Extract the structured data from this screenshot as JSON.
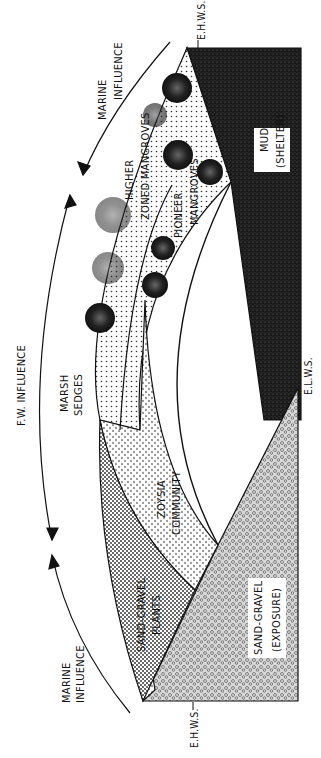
{
  "diagram": {
    "orientation": "rotated 90deg counter-clockwise (text reads bottom-to-top)",
    "colors": {
      "ink": "#111111",
      "mud": "#1a1a1a",
      "paper": "#ffffff",
      "stipple": "#555555"
    },
    "influence_labels": {
      "marine_top": [
        "MARINE",
        "INFLUENCE"
      ],
      "fw": "F.W. INFLUENCE",
      "marine_bottom": [
        "MARINE",
        "INFLUENCE"
      ]
    },
    "water_levels": {
      "ehws_top": "E.H.W.S.",
      "elws": "E.L.W.S.",
      "ehws_bottom": "E.H.W.S."
    },
    "zones": {
      "mud": [
        "MUD",
        "(SHELTER)"
      ],
      "higher_mangroves": [
        "HIGHER",
        "ZONED MANGROVES"
      ],
      "pioneer_mangroves": [
        "PIONEER",
        "MANGROVES"
      ],
      "marsh_sedges": [
        "MARSH",
        "SEDGES"
      ],
      "zoysia": [
        "ZOYSIA",
        "COMMUNITY"
      ],
      "sand_gravel_plants": [
        "SAND-GRAVEL",
        "PLANTS"
      ],
      "sand_gravel_exposure": [
        "SAND-GRAVEL",
        "(EXPOSURE)"
      ]
    }
  }
}
